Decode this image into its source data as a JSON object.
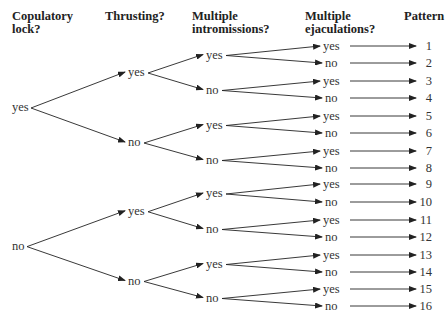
{
  "headers": {
    "col1": "Copulatory\nlock?",
    "col1_l1": "Copulatory",
    "col1_l2": "lock?",
    "col2": "Thrusting?",
    "col3_l1": "Multiple",
    "col3_l2": "intromissions?",
    "col4_l1": "Multiple",
    "col4_l2": "ejaculations?",
    "col5": "Pattern"
  },
  "tree": {
    "level1": [
      "yes",
      "no"
    ],
    "level2": [
      "yes",
      "no",
      "yes",
      "no"
    ],
    "level3": [
      "yes",
      "no",
      "yes",
      "no",
      "yes",
      "no",
      "yes",
      "no"
    ],
    "level4": [
      "yes",
      "no",
      "yes",
      "no",
      "yes",
      "no",
      "yes",
      "no",
      "yes",
      "no",
      "yes",
      "no",
      "yes",
      "no",
      "yes",
      "no"
    ],
    "patterns": [
      "1",
      "2",
      "3",
      "4",
      "5",
      "6",
      "7",
      "8",
      "9",
      "10",
      "11",
      "12",
      "13",
      "14",
      "15",
      "16"
    ]
  },
  "colors": {
    "line": "#222222",
    "text": "#333333"
  }
}
